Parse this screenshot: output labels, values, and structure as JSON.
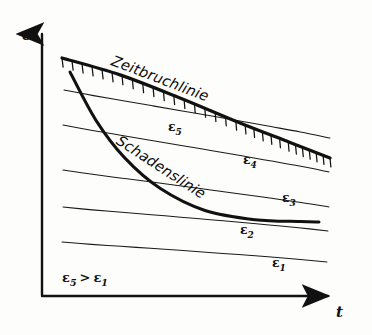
{
  "figure": {
    "kind": "hand-drawn-engineering-diagram",
    "language": "de",
    "background_color": "#fdfdfc",
    "ink_color": "#111111"
  },
  "axes": {
    "y": {
      "label": "σ",
      "name": "stress",
      "arrow": "up-arrow-icon"
    },
    "x": {
      "label": "t",
      "name": "time",
      "arrow": "right-arrow-icon"
    }
  },
  "annotations": {
    "relation": "ε₅ > ε₁",
    "relation_parts": {
      "left_symbol": "ε",
      "left_sub": "5",
      "operator": ">",
      "right_symbol": "ε",
      "right_sub": "1"
    }
  },
  "curves": [
    {
      "id": "zeitbruchlinie",
      "label": "Zeitbruchlinie",
      "style": "thick-hatched",
      "hatch_side": "below",
      "hatch_count": 30,
      "stroke_width": 3.2,
      "points": [
        [
          62,
          58
        ],
        [
          120,
          75
        ],
        [
          180,
          98
        ],
        [
          240,
          123
        ],
        [
          290,
          143
        ],
        [
          330,
          158
        ]
      ]
    },
    {
      "id": "schadenslinie",
      "label": "Schadenslinie",
      "style": "thick",
      "stroke_width": 3.0,
      "points": [
        [
          70,
          72
        ],
        [
          96,
          120
        ],
        [
          125,
          158
        ],
        [
          160,
          188
        ],
        [
          205,
          210
        ],
        [
          255,
          220
        ],
        [
          300,
          222
        ],
        [
          319,
          222
        ]
      ]
    }
  ],
  "chart_data": {
    "type": "line",
    "title": "",
    "xlabel": "t",
    "ylabel": "σ",
    "grid": false,
    "legend": "inline-labels",
    "annotations": [
      "Zeitbruchlinie",
      "Schadenslinie",
      "ε₅ > ε₁"
    ],
    "series": [
      {
        "name": "Zeitbruchlinie",
        "kind": "boundary-hatched",
        "points": [
          [
            62,
            58
          ],
          [
            120,
            75
          ],
          [
            180,
            98
          ],
          [
            240,
            123
          ],
          [
            290,
            143
          ],
          [
            330,
            158
          ]
        ]
      },
      {
        "name": "Schadenslinie",
        "kind": "boundary",
        "points": [
          [
            70,
            72
          ],
          [
            96,
            120
          ],
          [
            125,
            158
          ],
          [
            160,
            188
          ],
          [
            205,
            210
          ],
          [
            255,
            220
          ],
          [
            300,
            222
          ],
          [
            319,
            222
          ]
        ]
      },
      {
        "name": "ε₅",
        "kind": "iso-strain-rate",
        "points": [
          [
            64,
            90
          ],
          [
            330,
            138
          ]
        ]
      },
      {
        "name": "ε₄",
        "kind": "iso-strain-rate",
        "points": [
          [
            63,
            125
          ],
          [
            329,
            172
          ]
        ]
      },
      {
        "name": "ε₃",
        "kind": "iso-strain-rate",
        "points": [
          [
            63,
            170
          ],
          [
            329,
            207
          ]
        ]
      },
      {
        "name": "ε₂",
        "kind": "iso-strain-rate",
        "points": [
          [
            63,
            207
          ],
          [
            328,
            231
          ]
        ]
      },
      {
        "name": "ε₁",
        "kind": "iso-strain-rate",
        "points": [
          [
            62,
            242
          ],
          [
            327,
            262
          ]
        ]
      }
    ]
  },
  "strain_lines": [
    {
      "id": "eps5",
      "symbol": "ε",
      "sub": "5",
      "label_x": 168,
      "label_y": 119,
      "x1": 64,
      "y1": 90,
      "x2": 330,
      "y2": 138
    },
    {
      "id": "eps4",
      "symbol": "ε",
      "sub": "4",
      "label_x": 243,
      "label_y": 152,
      "x1": 63,
      "y1": 125,
      "x2": 329,
      "y2": 172
    },
    {
      "id": "eps3",
      "symbol": "ε",
      "sub": "3",
      "label_x": 282,
      "label_y": 190,
      "x1": 63,
      "y1": 170,
      "x2": 329,
      "y2": 207
    },
    {
      "id": "eps2",
      "symbol": "ε",
      "sub": "2",
      "label_x": 240,
      "label_y": 222,
      "x1": 63,
      "y1": 207,
      "x2": 328,
      "y2": 231
    },
    {
      "id": "eps1",
      "symbol": "ε",
      "sub": "1",
      "label_x": 272,
      "label_y": 255,
      "x1": 62,
      "y1": 242,
      "x2": 327,
      "y2": 262
    }
  ]
}
